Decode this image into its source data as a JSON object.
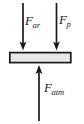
{
  "figure": {
    "type": "free-body-diagram",
    "title": "",
    "canvas": {
      "width": 84,
      "height": 124,
      "background": "#ffffff"
    },
    "plate": {
      "name": "plate",
      "x": 9,
      "y": 52,
      "width": 62,
      "height": 11,
      "fill": "#e8e8e8",
      "stroke": "#1a1a1a",
      "stroke_width": 1.6
    },
    "arrows": [
      {
        "name": "force-arrow-f-ar",
        "direction": "down",
        "x": 23,
        "y_start": 3,
        "y_end": 50,
        "color": "#1a1a1a",
        "label_id": "f_ar"
      },
      {
        "name": "force-arrow-f-p",
        "direction": "down",
        "x": 56.5,
        "y_start": 3,
        "y_end": 50,
        "color": "#1a1a1a",
        "label_id": "f_p"
      },
      {
        "name": "force-arrow-f-atm",
        "direction": "up",
        "x": 39,
        "y_start": 121,
        "y_end": 65,
        "color": "#1a1a1a",
        "label_id": "f_atm"
      }
    ],
    "labels": {
      "f_ar": {
        "symbol": "F",
        "subscript": "ar",
        "full": "F_ar"
      },
      "f_p": {
        "symbol": "F",
        "subscript": "p",
        "full": "F_p"
      },
      "f_atm": {
        "symbol": "F",
        "subscript": "atm",
        "full": "F_atm"
      }
    }
  }
}
